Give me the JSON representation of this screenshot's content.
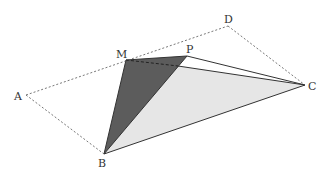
{
  "diagram": {
    "labels": {
      "A": "A",
      "B": "B",
      "C": "C",
      "D": "D",
      "M": "M",
      "P": "P"
    },
    "colors": {
      "dark_face": "#5c5c5c",
      "light_face": "#e6e6e6",
      "line": "#333333"
    }
  }
}
